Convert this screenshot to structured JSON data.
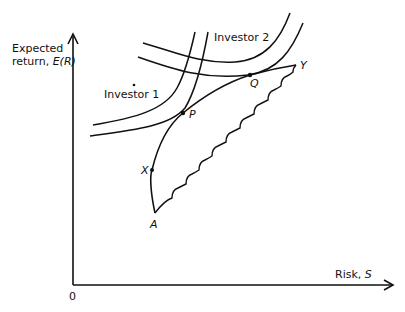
{
  "axes": {
    "y_label_line1": "Expected",
    "y_label_line2_prefix": "return, ",
    "y_label_symbol": "E(R)",
    "x_label_prefix": "Risk, ",
    "x_label_symbol": "S",
    "origin": "0"
  },
  "investors": {
    "investor1": "Investor 1",
    "investor2": "Investor 2"
  },
  "points": {
    "A": "A",
    "X": "X",
    "P": "P",
    "Q": "Q",
    "Y": "Y"
  },
  "colors": {
    "line": "#111111",
    "background": "#ffffff"
  }
}
